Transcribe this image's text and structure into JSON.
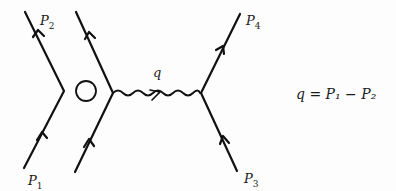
{
  "diagram": {
    "type": "feynman-diagram",
    "stroke_color": "#111111",
    "background_color": "#fdfdfd",
    "left_part": {
      "lines": [
        {
          "id": "p1-in",
          "label": "P",
          "sub": "1"
        },
        {
          "id": "p2-out",
          "label": "P",
          "sub": "2"
        }
      ],
      "symbol": "circled-dot"
    },
    "right_part": {
      "photon": {
        "label": "q"
      },
      "lines": [
        {
          "id": "p3-in",
          "label": "P",
          "sub": "3"
        },
        {
          "id": "p4-out",
          "label": "P",
          "sub": "4"
        }
      ]
    },
    "labels": {
      "p1": "P",
      "p1_sub": "1",
      "p2": "P",
      "p2_sub": "2",
      "p3": "P",
      "p3_sub": "3",
      "p4": "P",
      "p4_sub": "4",
      "q": "q"
    },
    "equation": "q = P₁ − P₂"
  }
}
